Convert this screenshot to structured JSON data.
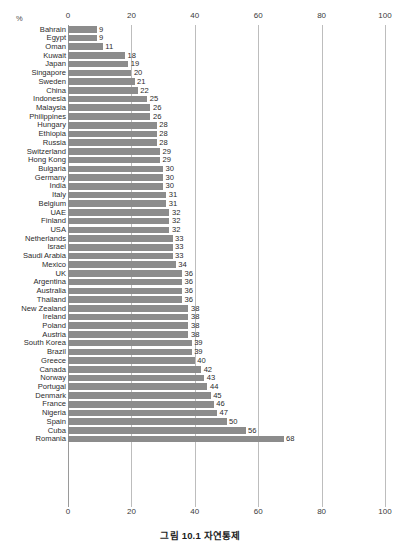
{
  "header_strip": {
    "text": "                         "
  },
  "axis": {
    "unit_label": "%",
    "tick_labels": [
      "0",
      "20",
      "40",
      "60",
      "80",
      "100"
    ]
  },
  "caption": {
    "text": "그림 10.1 자연통제"
  },
  "colors": {
    "bar": "#8c8c8c",
    "gridline": "#bdbdbd",
    "text": "#2b2b2b",
    "background": "#ffffff"
  },
  "chart_data": {
    "type": "bar",
    "orientation": "horizontal",
    "title": "그림 10.1 자연통제",
    "xlabel": "%",
    "ylabel": "",
    "xlim": [
      0,
      100
    ],
    "xticks": [
      0,
      20,
      40,
      60,
      80,
      100
    ],
    "grid": true,
    "legend": "none",
    "axis_position": "both-top-and-bottom",
    "data_labels": true,
    "sort": "ascending",
    "categories": [
      "Bahrain",
      "Egypt",
      "Oman",
      "Kuwait",
      "Japan",
      "Singapore",
      "Sweden",
      "China",
      "Indonesia",
      "Malaysia",
      "Philippines",
      "Hungary",
      "Ethiopia",
      "Russia",
      "Switzerland",
      "Hong Kong",
      "Bulgaria",
      "Germany",
      "India",
      "Italy",
      "Belgium",
      "UAE",
      "Finland",
      "USA",
      "Netherlands",
      "Israel",
      "Saudi Arabia",
      "Mexico",
      "UK",
      "Argentina",
      "Australia",
      "Thailand",
      "New Zealand",
      "Ireland",
      "Poland",
      "Austria",
      "South Korea",
      "Brazil",
      "Greece",
      "Canada",
      "Norway",
      "Portugal",
      "Denmark",
      "France",
      "Nigeria",
      "Spain",
      "Cuba",
      "Romania"
    ],
    "values": [
      9,
      9,
      11,
      18,
      19,
      20,
      21,
      22,
      25,
      26,
      26,
      28,
      28,
      28,
      29,
      29,
      30,
      30,
      30,
      31,
      31,
      32,
      32,
      32,
      33,
      33,
      33,
      34,
      36,
      36,
      36,
      36,
      38,
      38,
      38,
      38,
      39,
      39,
      40,
      42,
      43,
      44,
      45,
      46,
      47,
      50,
      56,
      68
    ]
  }
}
